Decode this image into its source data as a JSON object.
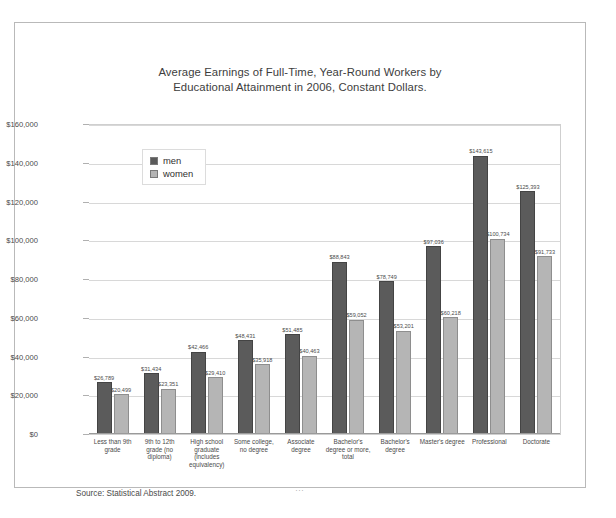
{
  "chart_data": {
    "type": "bar",
    "title": "Average Earnings of Full-Time, Year-Round Workers by Educational Attainment in 2006, Constant Dollars.",
    "title_lines": [
      "Average Earnings of Full-Time, Year-Round Workers by",
      "Educational Attainment in 2006, Constant Dollars."
    ],
    "xlabel": "",
    "ylabel": "",
    "ylim": [
      0,
      160000
    ],
    "ytick_values": [
      0,
      20000,
      40000,
      60000,
      80000,
      100000,
      120000,
      140000,
      160000
    ],
    "ytick_labels": [
      "$0",
      "$20,000",
      "$40,000",
      "$60,000",
      "$80,000",
      "$100,000",
      "$120,000",
      "$140,000",
      "$160,000"
    ],
    "grid": true,
    "legend_position": "upper-left-inside",
    "categories": [
      "Less than 9th grade",
      "9th to 12th grade (no diploma)",
      "High school graduate (includes equivalency)",
      "Some college, no degree",
      "Associate degree",
      "Bachelor's degree or more, total",
      "Bachelor's degree",
      "Master's degree",
      "Professional",
      "Doctorate"
    ],
    "series": [
      {
        "name": "men",
        "color": "#5b5b5b",
        "values": [
          26789,
          31434,
          42466,
          48431,
          51485,
          88843,
          78749,
          97036,
          143615,
          125393
        ],
        "labels": [
          "$26,789",
          "$31,434",
          "$42,466",
          "$48,431",
          "$51,485",
          "$88,843",
          "$78,749",
          "$97,036",
          "$143,615",
          "$125,393"
        ]
      },
      {
        "name": "women",
        "color": "#b5b5b5",
        "values": [
          20499,
          23351,
          29410,
          35918,
          40463,
          59052,
          53201,
          60218,
          100734,
          91733
        ],
        "labels": [
          "$20,499",
          "$23,351",
          "$29,410",
          "$35,918",
          "$40,463",
          "$59,052",
          "$53,201",
          "$60,218",
          "$100,734",
          "$91,733"
        ]
      }
    ]
  },
  "legend": {
    "items": [
      {
        "label": "men",
        "color": "#5b5b5b"
      },
      {
        "label": "women",
        "color": "#b5b5b5"
      }
    ]
  },
  "source_note": "Source: Statistical Abstract 2009.",
  "footer_mark": "..."
}
